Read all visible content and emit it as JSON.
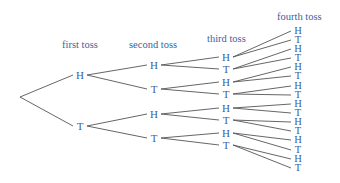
{
  "diagram": {
    "type": "probability-tree",
    "headers": {
      "first": "first toss",
      "second": "second toss",
      "third": "third toss",
      "fourth": "fourth toss"
    },
    "root": {
      "x": 20,
      "y": 97
    },
    "levels": [
      {
        "x": 80,
        "nodes": [
          {
            "label": "H",
            "y": 75
          },
          {
            "label": "T",
            "y": 126
          }
        ]
      },
      {
        "x": 154,
        "nodes": [
          {
            "label": "H",
            "y": 65
          },
          {
            "label": "T",
            "y": 89
          },
          {
            "label": "H",
            "y": 114
          },
          {
            "label": "T",
            "y": 138
          }
        ]
      },
      {
        "x": 226,
        "nodes": [
          {
            "label": "H",
            "y": 57
          },
          {
            "label": "T",
            "y": 69
          },
          {
            "label": "H",
            "y": 82
          },
          {
            "label": "T",
            "y": 94
          },
          {
            "label": "H",
            "y": 108
          },
          {
            "label": "T",
            "y": 120
          },
          {
            "label": "H",
            "y": 133
          },
          {
            "label": "T",
            "y": 145
          }
        ]
      },
      {
        "x": 298,
        "nodes": [
          {
            "label": "H",
            "y": 31
          },
          {
            "label": "T",
            "y": 40
          },
          {
            "label": "H",
            "y": 49
          },
          {
            "label": "T",
            "y": 58
          },
          {
            "label": "H",
            "y": 67
          },
          {
            "label": "T",
            "y": 76
          },
          {
            "label": "H",
            "y": 86
          },
          {
            "label": "T",
            "y": 95
          },
          {
            "label": "H",
            "y": 104
          },
          {
            "label": "T",
            "y": 113
          },
          {
            "label": "H",
            "y": 122
          },
          {
            "label": "T",
            "y": 131
          },
          {
            "label": "H",
            "y": 140
          },
          {
            "label": "T",
            "y": 150
          },
          {
            "label": "H",
            "y": 159
          },
          {
            "label": "T",
            "y": 168
          }
        ]
      }
    ],
    "colors": {
      "text": "#3a5fa0",
      "line": "#555555"
    }
  }
}
